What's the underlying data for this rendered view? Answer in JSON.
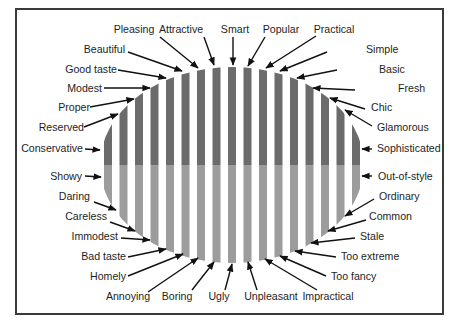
{
  "figure": {
    "ellipse": {
      "cx": 232,
      "cy": 165,
      "rx": 132,
      "ry": 98
    },
    "stripes": {
      "count": 17,
      "width": 8,
      "pitch": 15.5
    },
    "colors": {
      "top_stripe": "#6b6b6b",
      "bottom_stripe": "#9c9c9c",
      "frame": "#3a3a3a",
      "text": "#1e1e1e",
      "arrow": "#111111"
    }
  },
  "labels": {
    "top": [
      {
        "text": "Pleasing",
        "x": 134,
        "y": 33,
        "anchor": "middle",
        "ax": 160,
        "ay": 37,
        "tx": 198,
        "ty": 68
      },
      {
        "text": "Attractive",
        "x": 181,
        "y": 33,
        "anchor": "middle",
        "ax": 204,
        "ay": 37,
        "tx": 214,
        "ty": 65
      },
      {
        "text": "Smart",
        "x": 235,
        "y": 33,
        "anchor": "middle",
        "ax": 233,
        "ay": 37,
        "tx": 233,
        "ty": 65
      },
      {
        "text": "Popular",
        "x": 281,
        "y": 33,
        "anchor": "middle",
        "ax": 265,
        "ay": 37,
        "tx": 248,
        "ty": 66
      },
      {
        "text": "Practical",
        "x": 334,
        "y": 33,
        "anchor": "middle",
        "ax": 316,
        "ay": 36,
        "tx": 266,
        "ty": 68
      }
    ],
    "left_upper": [
      {
        "text": "Beautiful",
        "x": 125,
        "y": 53,
        "anchor": "end",
        "ax": 128,
        "ay": 52,
        "tx": 182,
        "ty": 71
      },
      {
        "text": "Good taste",
        "x": 117,
        "y": 73,
        "anchor": "end",
        "ax": 118,
        "ay": 70,
        "tx": 166,
        "ty": 78
      },
      {
        "text": "Modest",
        "x": 102,
        "y": 92,
        "anchor": "end",
        "ax": 104,
        "ay": 88,
        "tx": 150,
        "ty": 88
      },
      {
        "text": "Proper",
        "x": 90,
        "y": 111,
        "anchor": "end",
        "ax": 90,
        "ay": 107,
        "tx": 134,
        "ty": 99
      },
      {
        "text": "Reserved",
        "x": 84,
        "y": 131,
        "anchor": "end",
        "ax": 84,
        "ay": 127,
        "tx": 118,
        "ty": 114
      },
      {
        "text": "Conservative",
        "x": 83,
        "y": 152,
        "anchor": "end",
        "ax": 85,
        "ay": 149,
        "tx": 100,
        "ty": 150
      }
    ],
    "right_upper": [
      {
        "text": "Simple",
        "x": 366,
        "y": 53,
        "anchor": "start",
        "ax": 327,
        "ay": 52,
        "tx": 280,
        "ty": 71
      },
      {
        "text": "Basic",
        "x": 379,
        "y": 73,
        "anchor": "start",
        "ax": 337,
        "ay": 70,
        "tx": 297,
        "ty": 78
      },
      {
        "text": "Fresh",
        "x": 398,
        "y": 92,
        "anchor": "start",
        "ax": 355,
        "ay": 90,
        "tx": 313,
        "ty": 88
      },
      {
        "text": "Chic",
        "x": 371,
        "y": 111,
        "anchor": "start",
        "ax": 365,
        "ay": 109,
        "tx": 330,
        "ty": 98
      },
      {
        "text": "Glamorous",
        "x": 377,
        "y": 131,
        "anchor": "start",
        "ax": 372,
        "ay": 126,
        "tx": 345,
        "ty": 110
      },
      {
        "text": "Sophisticated",
        "x": 377,
        "y": 152,
        "anchor": "start",
        "ax": 372,
        "ay": 149,
        "tx": 362,
        "ty": 149
      }
    ],
    "left_lower": [
      {
        "text": "Showy",
        "x": 82,
        "y": 180,
        "anchor": "end",
        "ax": 85,
        "ay": 176,
        "tx": 101,
        "ty": 177
      },
      {
        "text": "Daring",
        "x": 90,
        "y": 200,
        "anchor": "end",
        "ax": 94,
        "ay": 202,
        "tx": 116,
        "ty": 210
      },
      {
        "text": "Careless",
        "x": 107,
        "y": 220,
        "anchor": "end",
        "ax": 110,
        "ay": 222,
        "tx": 135,
        "ty": 231
      },
      {
        "text": "Immodest",
        "x": 118,
        "y": 240,
        "anchor": "end",
        "ax": 121,
        "ay": 238,
        "tx": 150,
        "ty": 240
      },
      {
        "text": "Bad taste",
        "x": 126,
        "y": 260,
        "anchor": "end",
        "ax": 128,
        "ay": 257,
        "tx": 166,
        "ty": 249
      },
      {
        "text": "Homely",
        "x": 126,
        "y": 280,
        "anchor": "end",
        "ax": 128,
        "ay": 276,
        "tx": 183,
        "ty": 254
      }
    ],
    "right_lower": [
      {
        "text": "Out-of-style",
        "x": 378,
        "y": 180,
        "anchor": "start",
        "ax": 372,
        "ay": 176,
        "tx": 362,
        "ty": 176
      },
      {
        "text": "Ordinary",
        "x": 379,
        "y": 200,
        "anchor": "start",
        "ax": 374,
        "ay": 199,
        "tx": 345,
        "ty": 216
      },
      {
        "text": "Common",
        "x": 369,
        "y": 220,
        "anchor": "start",
        "ax": 366,
        "ay": 220,
        "tx": 328,
        "ty": 231
      },
      {
        "text": "Stale",
        "x": 360,
        "y": 240,
        "anchor": "start",
        "ax": 355,
        "ay": 238,
        "tx": 311,
        "ty": 243
      },
      {
        "text": "Too extreme",
        "x": 341,
        "y": 260,
        "anchor": "start",
        "ax": 336,
        "ay": 257,
        "tx": 295,
        "ty": 251
      },
      {
        "text": "Too fancy",
        "x": 331,
        "y": 280,
        "anchor": "start",
        "ax": 326,
        "ay": 276,
        "tx": 280,
        "ty": 256
      }
    ],
    "bottom": [
      {
        "text": "Annoying",
        "x": 128,
        "y": 300,
        "anchor": "middle",
        "ax": 148,
        "ay": 292,
        "tx": 198,
        "ty": 258
      },
      {
        "text": "Boring",
        "x": 177,
        "y": 300,
        "anchor": "middle",
        "ax": 192,
        "ay": 290,
        "tx": 214,
        "ty": 262
      },
      {
        "text": "Ugly",
        "x": 219,
        "y": 300,
        "anchor": "middle",
        "ax": 225,
        "ay": 290,
        "tx": 232,
        "ty": 264
      },
      {
        "text": "Unpleasant",
        "x": 271,
        "y": 300,
        "anchor": "middle",
        "ax": 257,
        "ay": 290,
        "tx": 248,
        "ty": 262
      },
      {
        "text": "Impractical",
        "x": 328,
        "y": 300,
        "anchor": "middle",
        "ax": 317,
        "ay": 290,
        "tx": 265,
        "ty": 259
      }
    ]
  }
}
